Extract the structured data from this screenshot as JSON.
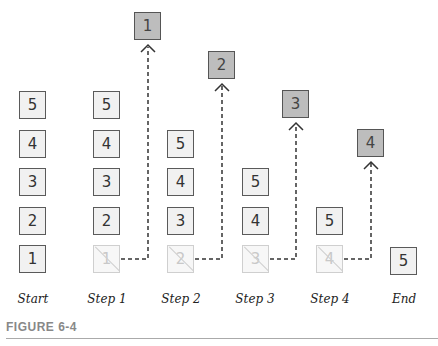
{
  "figure": {
    "caption": "FIGURE 6-4",
    "columns": [
      {
        "label": "Start",
        "stack": [
          "1",
          "2",
          "3",
          "4",
          "5"
        ],
        "removed": null,
        "popped": null
      },
      {
        "label": "Step 1",
        "stack": [
          "2",
          "3",
          "4",
          "5"
        ],
        "removed": "1",
        "popped": "1"
      },
      {
        "label": "Step 2",
        "stack": [
          "3",
          "4",
          "5"
        ],
        "removed": "2",
        "popped": "2"
      },
      {
        "label": "Step 3",
        "stack": [
          "4",
          "5"
        ],
        "removed": "3",
        "popped": "3"
      },
      {
        "label": "Step 4",
        "stack": [
          "5"
        ],
        "removed": "4",
        "popped": "4"
      },
      {
        "label": "End",
        "stack": [
          "5"
        ],
        "removed": null,
        "popped": null
      }
    ]
  },
  "colors": {
    "box_fill": "#f1f1f1",
    "box_border": "#5a5a5a",
    "popped_fill": "#bdbdbd",
    "removed_border": "#cfcfcf",
    "dash_line": "#333333"
  }
}
